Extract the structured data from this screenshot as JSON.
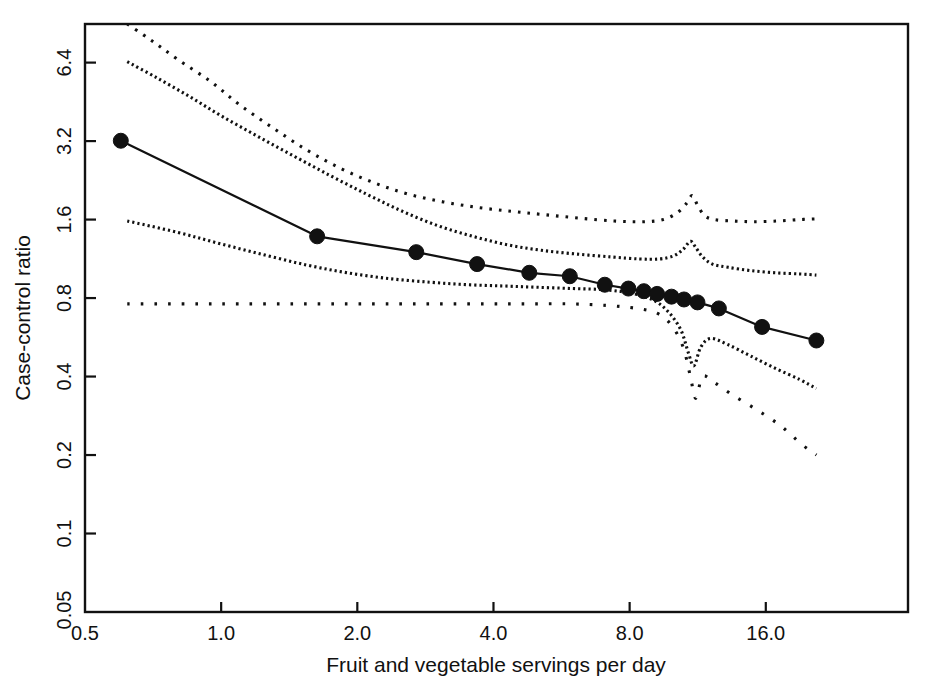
{
  "chart_data": {
    "type": "line",
    "title": "",
    "xlabel": "Fruit and vegetable servings per day",
    "ylabel": "Case-control ratio",
    "xscale": "log2",
    "yscale": "log2",
    "xlim": [
      0.5,
      33.0
    ],
    "ylim": [
      0.05,
      9.0
    ],
    "grid": false,
    "legend": "none",
    "xticks": [
      "0.5",
      "1.0",
      "2.0",
      "4.0",
      "8.0",
      "16.0"
    ],
    "xtick_values": [
      0.5,
      1.0,
      2.0,
      4.0,
      8.0,
      16.0
    ],
    "yticks": [
      "0.05",
      "0.1",
      "0.2",
      "0.4",
      "0.8",
      "1.6",
      "3.2",
      "6.4"
    ],
    "ytick_values": [
      0.05,
      0.1,
      0.2,
      0.4,
      0.8,
      1.6,
      3.2,
      6.4
    ],
    "series": [
      {
        "name": "Case-control ratio (fitted, with markers)",
        "style": "solid-with-circles",
        "x": [
          0.6,
          1.63,
          2.7,
          3.68,
          4.8,
          5.9,
          7.05,
          7.95,
          8.6,
          9.2,
          9.9,
          10.55,
          11.3,
          12.6,
          15.7,
          20.7
        ],
        "y": [
          3.21,
          1.38,
          1.2,
          1.08,
          1.0,
          0.97,
          0.9,
          0.87,
          0.85,
          0.83,
          0.81,
          0.79,
          0.77,
          0.73,
          0.62,
          0.55
        ]
      },
      {
        "name": "Upper outer confidence band",
        "style": "dotted-sparse",
        "x": [
          0.62,
          0.7,
          0.8,
          0.95,
          1.1,
          1.3,
          1.55,
          1.85,
          2.2,
          2.6,
          3.1,
          3.7,
          4.4,
          5.2,
          6.2,
          7.4,
          8.6,
          9.5,
          10.2,
          10.7,
          11.0,
          11.3,
          11.7,
          12.3,
          13.5,
          15.0,
          17.0,
          19.0,
          20.7
        ],
        "y": [
          9.0,
          7.8,
          6.6,
          5.4,
          4.4,
          3.6,
          2.95,
          2.5,
          2.2,
          2.0,
          1.87,
          1.78,
          1.72,
          1.67,
          1.62,
          1.58,
          1.57,
          1.6,
          1.7,
          1.85,
          1.98,
          1.82,
          1.66,
          1.6,
          1.58,
          1.57,
          1.58,
          1.6,
          1.61
        ]
      },
      {
        "name": "Upper inner confidence band",
        "style": "dotted-dense",
        "x": [
          0.62,
          0.72,
          0.85,
          1.0,
          1.2,
          1.45,
          1.75,
          2.1,
          2.5,
          3.0,
          3.6,
          4.3,
          5.1,
          6.1,
          7.3,
          8.4,
          9.3,
          10.0,
          10.5,
          10.9,
          11.2,
          11.6,
          12.2,
          13.2,
          14.8,
          16.8,
          19.0,
          20.7
        ],
        "y": [
          6.45,
          5.6,
          4.75,
          4.0,
          3.35,
          2.8,
          2.35,
          2.0,
          1.73,
          1.52,
          1.38,
          1.28,
          1.22,
          1.18,
          1.15,
          1.13,
          1.13,
          1.16,
          1.23,
          1.32,
          1.25,
          1.15,
          1.08,
          1.05,
          1.02,
          1.0,
          0.99,
          0.98
        ]
      },
      {
        "name": "Lower inner confidence band",
        "style": "dotted-dense",
        "x": [
          0.62,
          0.8,
          1.0,
          1.25,
          1.55,
          1.9,
          2.35,
          2.9,
          3.5,
          4.2,
          5.0,
          6.0,
          7.1,
          8.2,
          9.1,
          9.8,
          10.4,
          10.8,
          11.1,
          11.5,
          12.1,
          13.2,
          14.8,
          16.8,
          19.0,
          20.7
        ],
        "y": [
          1.58,
          1.43,
          1.29,
          1.17,
          1.07,
          1.0,
          0.95,
          0.92,
          0.9,
          0.89,
          0.88,
          0.87,
          0.86,
          0.83,
          0.78,
          0.7,
          0.6,
          0.49,
          0.44,
          0.52,
          0.56,
          0.53,
          0.48,
          0.43,
          0.39,
          0.36
        ]
      },
      {
        "name": "Lower outer confidence band",
        "style": "dotted-wide",
        "x": [
          0.62,
          0.85,
          1.1,
          1.45,
          1.9,
          2.45,
          3.1,
          3.9,
          4.8,
          5.9,
          7.1,
          8.3,
          9.2,
          9.9,
          10.5,
          10.9,
          11.2,
          11.6,
          12.3,
          13.5,
          15.2,
          17.2,
          19.2,
          20.7
        ],
        "y": [
          0.76,
          0.76,
          0.76,
          0.76,
          0.76,
          0.76,
          0.76,
          0.76,
          0.76,
          0.76,
          0.75,
          0.73,
          0.7,
          0.63,
          0.52,
          0.4,
          0.33,
          0.4,
          0.38,
          0.34,
          0.3,
          0.26,
          0.22,
          0.2
        ]
      }
    ]
  },
  "plot_geometry": {
    "left": 85,
    "right": 908,
    "top": 24,
    "bottom": 612
  },
  "colors": {
    "ink": "#111111",
    "background": "#ffffff"
  }
}
